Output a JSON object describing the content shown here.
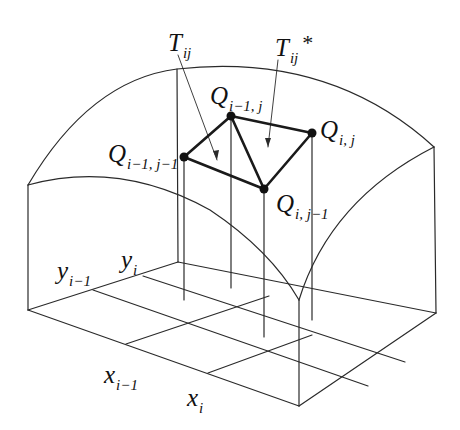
{
  "diagram": {
    "labels": {
      "T_ij": {
        "main": "T",
        "sub": "ij"
      },
      "T_ij_star": {
        "main": "T",
        "sub": "ij",
        "sup": "*"
      },
      "Q_im1_j": {
        "main": "Q",
        "sub": "i−1, j"
      },
      "Q_i_j": {
        "main": "Q",
        "sub": "i, j"
      },
      "Q_im1_jm1": {
        "main": "Q",
        "sub": "i−1, j−1"
      },
      "Q_i_jm1": {
        "main": "Q",
        "sub": "i, j−1"
      },
      "y_im1": {
        "main": "y",
        "sub": "i−1"
      },
      "y_i": {
        "main": "y",
        "sub": "i"
      },
      "x_im1": {
        "main": "x",
        "sub": "i−1"
      },
      "x_i": {
        "main": "x",
        "sub": "i"
      }
    },
    "points": {
      "Q_im1_jm1": [
        184,
        157
      ],
      "Q_im1_j": [
        231,
        116
      ],
      "Q_i_j": [
        312,
        133
      ],
      "Q_i_jm1": [
        264,
        189
      ]
    },
    "colors": {
      "stroke": "#222222",
      "background": "#ffffff"
    }
  }
}
